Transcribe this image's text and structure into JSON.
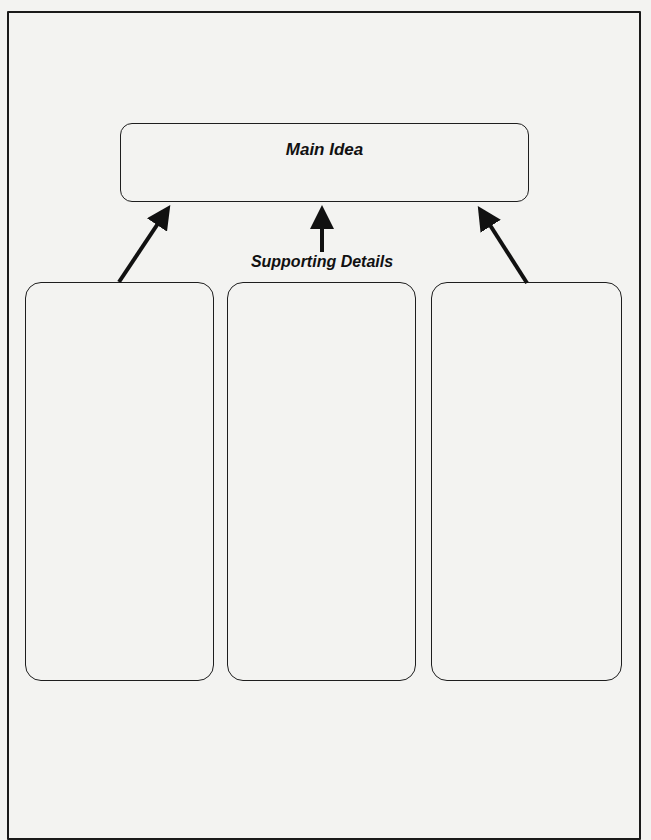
{
  "diagram": {
    "main_idea": {
      "label": "Main Idea"
    },
    "connector_label": "Supporting Details",
    "detail_boxes": [
      {
        "label": ""
      },
      {
        "label": ""
      },
      {
        "label": ""
      }
    ],
    "arrows": [
      {
        "from": "detail-box-1",
        "to": "main-idea-box"
      },
      {
        "from": "supporting-details-label",
        "to": "main-idea-box"
      },
      {
        "from": "detail-box-3",
        "to": "main-idea-box"
      }
    ],
    "colors": {
      "ink": "#111111",
      "paper": "#f3f3f1"
    }
  }
}
